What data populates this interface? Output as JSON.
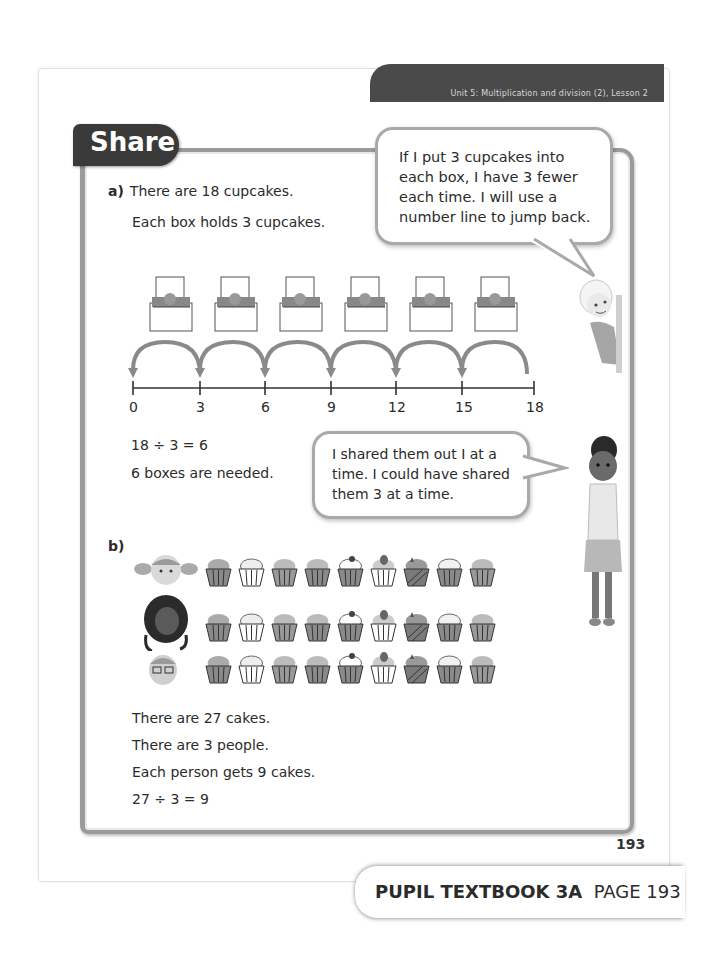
{
  "header": {
    "unit_banner": "Unit 5: Multiplication and division (2), Lesson 2"
  },
  "section_tab": "Share",
  "part_a": {
    "label": "a)",
    "line1": "There are 18 cupcakes.",
    "line2": "Each box holds 3 cupcakes.",
    "boxes_count": 6,
    "number_line": {
      "ticks": [
        "0",
        "3",
        "6",
        "9",
        "12",
        "15",
        "18"
      ],
      "jump_size": 3,
      "direction": "backward"
    },
    "equation": "18 ÷ 3 = 6",
    "conclusion": "6 boxes are needed."
  },
  "bubble_top": {
    "lines": [
      "If I put 3 cupcakes into",
      "each box, I have 3 fewer",
      "each time. I will use a",
      "number line to jump back."
    ]
  },
  "bubble_middle": {
    "lines": [
      "I shared them out I at a",
      "time. I could have shared",
      "them 3 at a time."
    ]
  },
  "part_b": {
    "label": "b)",
    "people": [
      "girl-with-pigtails",
      "girl-with-dark-curly-hair",
      "boy-with-glasses"
    ],
    "cupcakes_per_row": 9,
    "line1": "There are 27 cakes.",
    "line2": "There are 3 people.",
    "line3": "Each person gets 9 cakes.",
    "equation": "27 ÷ 3 = 9"
  },
  "page_number": "193",
  "footer": {
    "book": "PUPIL TEXTBOOK 3A",
    "page": "PAGE 193"
  },
  "colors": {
    "banner": "#4a4a4a",
    "tab": "#3a3a3a",
    "frame": "#9a9a9a",
    "arc": "#8a8a8a"
  }
}
